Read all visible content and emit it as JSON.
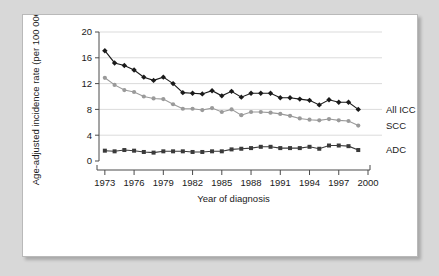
{
  "chart_data": {
    "type": "line",
    "title": "",
    "xlabel": "Year of diagnosis",
    "ylabel": "Age-adjusted incidence rate (per 100 000)",
    "xlim": [
      1972.4,
      2000
    ],
    "ylim": [
      0,
      20
    ],
    "xticks": [
      "1973",
      "1976",
      "1979",
      "1982",
      "1985",
      "1988",
      "1991",
      "1994",
      "1997",
      "2000"
    ],
    "xtick_values": [
      1973,
      1976,
      1979,
      1982,
      1985,
      1988,
      1991,
      1994,
      1997,
      2000
    ],
    "yticks": [
      "0",
      "4",
      "8",
      "12",
      "16",
      "20"
    ],
    "ytick_values": [
      0,
      4,
      8,
      12,
      16,
      20
    ],
    "grid": "horizontal",
    "legend_position": "right-inline",
    "x": [
      1973,
      1974,
      1975,
      1976,
      1977,
      1978,
      1979,
      1980,
      1981,
      1982,
      1983,
      1984,
      1985,
      1986,
      1987,
      1988,
      1989,
      1990,
      1991,
      1992,
      1993,
      1994,
      1995,
      1996,
      1997,
      1998,
      1999
    ],
    "series": [
      {
        "name": "All ICC",
        "label": "All ICC",
        "color": "#1a1a1a",
        "marker": "diamond",
        "values": [
          17.1,
          15.2,
          14.8,
          14.1,
          13.0,
          12.5,
          13.0,
          12.0,
          10.6,
          10.5,
          10.4,
          10.9,
          10.1,
          10.8,
          9.9,
          10.5,
          10.5,
          10.5,
          9.8,
          9.8,
          9.6,
          9.4,
          8.7,
          9.5,
          9.1,
          9.1,
          8.0
        ]
      },
      {
        "name": "SCC",
        "label": "SCC",
        "color": "#9a9a9a",
        "marker": "circle",
        "values": [
          12.9,
          11.8,
          11.0,
          10.7,
          10.0,
          9.7,
          9.6,
          8.8,
          8.1,
          8.1,
          7.9,
          8.2,
          7.6,
          8.0,
          7.1,
          7.6,
          7.6,
          7.5,
          7.3,
          7.0,
          6.6,
          6.4,
          6.3,
          6.5,
          6.3,
          6.2,
          5.5
        ]
      },
      {
        "name": "ADC",
        "label": "ADC",
        "color": "#3a3a3a",
        "marker": "square",
        "values": [
          1.6,
          1.5,
          1.7,
          1.6,
          1.4,
          1.3,
          1.5,
          1.5,
          1.5,
          1.4,
          1.4,
          1.5,
          1.5,
          1.8,
          1.9,
          2.0,
          2.2,
          2.2,
          2.0,
          2.0,
          2.0,
          2.2,
          1.9,
          2.4,
          2.4,
          2.3,
          1.7
        ]
      }
    ]
  }
}
